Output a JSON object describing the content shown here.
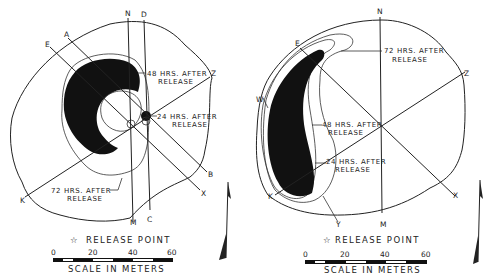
{
  "figures": [
    {
      "id": "left",
      "axis_labels": {
        "N": "N",
        "D": "D",
        "A": "A",
        "E": "E",
        "Z": "Z",
        "B": "B",
        "X": "X",
        "C": "C",
        "M": "M",
        "K": "K"
      },
      "annotations": {
        "h48_line1": "48 HRS. AFTER",
        "h48_line2": "RELEASE",
        "h24_line1": "24 HRS. AFTER",
        "h24_line2": "RELEASE",
        "h72_line1": "72 HRS. AFTER",
        "h72_line2": "RELEASE"
      },
      "legend": {
        "release_point": "RELEASE POINT",
        "star": "☆"
      },
      "scale": {
        "ticks": [
          "0",
          "20",
          "40",
          "60"
        ],
        "title": "SCALE IN METERS"
      }
    },
    {
      "id": "right",
      "axis_labels": {
        "N": "N",
        "E": "E",
        "Z": "Z",
        "W": "W",
        "K": "K",
        "Y": "Y",
        "M": "M",
        "X": "X"
      },
      "annotations": {
        "h72_line1": "72 HRS. AFTER",
        "h72_line2": "RELEASE",
        "h48_line1": "48 HRS. AFTER",
        "h48_line2": "RELEASE",
        "h24_line1": "24 HRS. AFTER",
        "h24_line2": "RELEASE"
      },
      "legend": {
        "release_point": "RELEASE POINT",
        "star": "☆"
      },
      "scale": {
        "ticks": [
          "0",
          "20",
          "40",
          "60"
        ],
        "title": "SCALE IN METERS"
      }
    }
  ],
  "colors": {
    "ink": "#222222",
    "plume": "#111111",
    "background": "#ffffff"
  }
}
